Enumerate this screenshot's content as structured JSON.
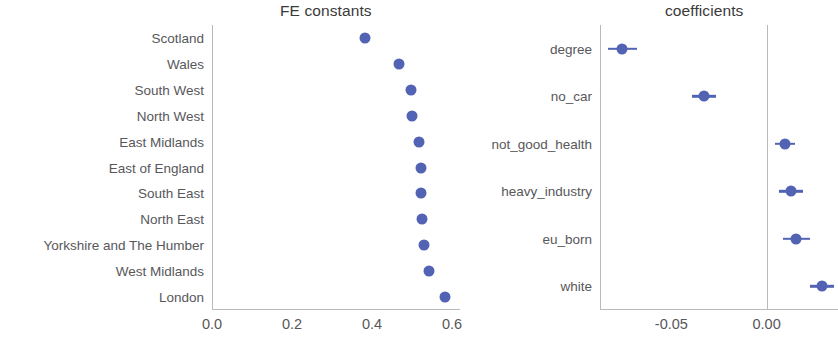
{
  "chart_data": [
    {
      "type": "scatter",
      "panel": "left",
      "title": "FE constants",
      "xlabel": "",
      "ylabel": "",
      "orientation": "horizontal",
      "xlim": [
        0.0,
        0.62
      ],
      "xticks": [
        "0.0",
        "0.2",
        "0.4",
        "0.6"
      ],
      "xtick_values": [
        0.0,
        0.2,
        0.4,
        0.6
      ],
      "grid": false,
      "legend": "none",
      "categories": [
        "Scotland",
        "Wales",
        "South West",
        "North West",
        "East Midlands",
        "East of England",
        "South East",
        "North East",
        "Yorkshire and The Humber",
        "West Midlands",
        "London"
      ],
      "values": [
        0.382,
        0.468,
        0.498,
        0.5,
        0.518,
        0.522,
        0.522,
        0.525,
        0.53,
        0.543,
        0.583
      ],
      "marker_color": "#5363b4"
    },
    {
      "type": "scatter",
      "panel": "right",
      "title": "coefficients",
      "xlabel": "",
      "ylabel": "",
      "orientation": "horizontal",
      "xlim": [
        -0.0875,
        0.0375
      ],
      "xticks": [
        "-0.05",
        "0.00"
      ],
      "xtick_values": [
        -0.05,
        0.0
      ],
      "grid": false,
      "legend": "none",
      "reference_line": 0.0,
      "categories": [
        "degree",
        "no_car",
        "not_good_health",
        "heavy_industry",
        "eu_born",
        "white"
      ],
      "values": [
        -0.0758,
        -0.0328,
        0.0097,
        0.0129,
        0.0156,
        0.029
      ],
      "errors": [
        0.0075,
        0.0062,
        0.0052,
        0.0062,
        0.0072,
        0.0062
      ],
      "marker_color": "#5363b4"
    }
  ],
  "panels": {
    "left": {
      "title": "FE constants",
      "xticks": [
        "0.0",
        "0.2",
        "0.4",
        "0.6"
      ],
      "categories": [
        "Scotland",
        "Wales",
        "South West",
        "North West",
        "East Midlands",
        "East of England",
        "South East",
        "North East",
        "Yorkshire and The Humber",
        "West Midlands",
        "London"
      ]
    },
    "right": {
      "title": "coefficients",
      "xticks": [
        "-0.05",
        "0.00"
      ],
      "categories": [
        "degree",
        "no_car",
        "not_good_health",
        "heavy_industry",
        "eu_born",
        "white"
      ]
    }
  }
}
